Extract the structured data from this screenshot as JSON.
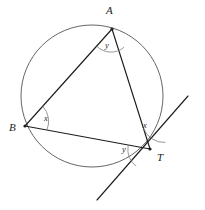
{
  "figure": {
    "kind": "circle-geometry-diagram",
    "background_color": "#ffffff",
    "line_color": "#1d1d1d",
    "circle_color": "#555555",
    "arc_color": "#777777",
    "circle": {
      "center_x": 92,
      "center_y": 96,
      "radius": 71
    },
    "points": [
      {
        "id": "A",
        "label": "A",
        "x": 112,
        "y": 29,
        "label_x": 106,
        "label_y": 14
      },
      {
        "id": "B",
        "label": "B",
        "x": 25,
        "y": 126,
        "label_x": 9,
        "label_y": 131
      },
      {
        "id": "T",
        "label": "T",
        "x": 150,
        "y": 149,
        "label_x": 157,
        "label_y": 161
      }
    ],
    "segments": [
      {
        "id": "AB",
        "from": "A",
        "to": "B",
        "x1": 112,
        "y1": 29,
        "x2": 25,
        "y2": 126
      },
      {
        "id": "AT",
        "from": "A",
        "to": "T",
        "x1": 112,
        "y1": 29,
        "x2": 150,
        "y2": 149
      },
      {
        "id": "BT",
        "from": "B",
        "to": "T",
        "x1": 25,
        "y1": 126,
        "x2": 150,
        "y2": 149
      }
    ],
    "tangent": {
      "id": "tangent-at-T",
      "touch_point": "T",
      "x1": 97,
      "y1": 200,
      "x2": 188,
      "y2": 96
    },
    "angles": [
      {
        "id": "angle-at-A",
        "label": "y",
        "vertex": "A",
        "label_x": 105,
        "label_y": 48,
        "arc_path": "M 96.3 45.7 A 20 20 0 0 0 124.1 47.2"
      },
      {
        "id": "angle-at-B",
        "label": "x",
        "vertex": "B",
        "label_x": 44,
        "label_y": 121,
        "arc_path": "M 42.8 106.4 A 22 22 0 0 1 46.9 130.0"
      },
      {
        "id": "angle-at-T-upper",
        "label": "x",
        "vertex": "T",
        "label_x": 143,
        "label_y": 128,
        "arc_path": "M 143.4 128.1 A 22 22 0 0 0 165.4 142.4"
      },
      {
        "id": "angle-at-T-lower",
        "label": "y",
        "vertex": "T",
        "label_x": 122,
        "label_y": 152,
        "arc_path": "M 128.1 145.9 A 22 22 0 0 0 136.1 166.2"
      }
    ]
  }
}
